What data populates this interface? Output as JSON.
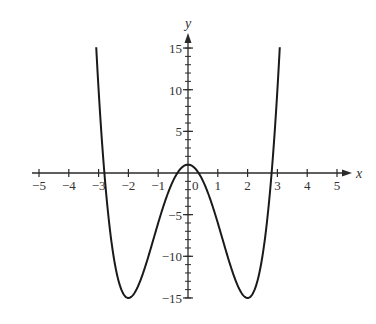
{
  "chart_data": {
    "type": "line",
    "title": "",
    "xlabel": "x",
    "ylabel": "y",
    "xlim": [
      -5,
      5
    ],
    "ylim": [
      -15,
      15
    ],
    "grid": false,
    "legend": null,
    "x_ticks": [
      -5,
      -4,
      -3,
      -2,
      -1,
      0,
      1,
      2,
      3,
      4,
      5
    ],
    "x_tick_labels": [
      "−5",
      "−4",
      "−3",
      "−2",
      "−1",
      "0",
      "1",
      "2",
      "3",
      "4",
      "5"
    ],
    "y_major_ticks": [
      15,
      10,
      5,
      -5,
      -10,
      -15
    ],
    "y_tick_labels": [
      "15",
      "10",
      "5",
      "−5",
      "−10",
      "−15"
    ],
    "y_minor_tick_step": 1,
    "series": [
      {
        "name": "y = x^4 - 8x^2 + 1",
        "color": "#1a1a1a",
        "x_range": [
          -3.08,
          3.08
        ],
        "points": [
          [
            -3.08,
            15.0
          ],
          [
            -3.0,
            10.0
          ],
          [
            -2.83,
            0.0
          ],
          [
            -2.5,
            -10.94
          ],
          [
            -2.0,
            -15.0
          ],
          [
            -1.5,
            -11.94
          ],
          [
            -1.0,
            -6.0
          ],
          [
            -0.5,
            -0.94
          ],
          [
            0.0,
            1.0
          ],
          [
            0.5,
            -0.94
          ],
          [
            1.0,
            -6.0
          ],
          [
            1.5,
            -11.94
          ],
          [
            2.0,
            -15.0
          ],
          [
            2.5,
            -10.94
          ],
          [
            2.83,
            0.0
          ],
          [
            3.0,
            10.0
          ],
          [
            3.08,
            15.0
          ]
        ]
      }
    ],
    "annotations": {
      "local_max": [
        0,
        1
      ],
      "local_min": [
        [
          -2,
          -15
        ],
        [
          2,
          -15
        ]
      ]
    }
  }
}
